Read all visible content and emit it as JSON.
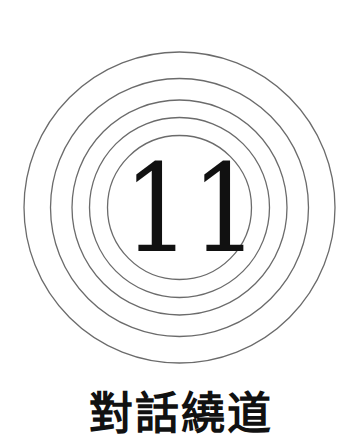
{
  "emblem": {
    "number": "11",
    "digits": [
      "1",
      "1"
    ],
    "rings": [
      {
        "cx": 179.5,
        "cy": 207.5,
        "r": 155.5
      },
      {
        "cx": 179.5,
        "cy": 207.5,
        "r": 129
      },
      {
        "cx": 179.5,
        "cy": 207.5,
        "r": 107.5
      },
      {
        "cx": 179.5,
        "cy": 207.5,
        "r": 90
      },
      {
        "cx": 179.5,
        "cy": 207.5,
        "r": 72
      }
    ],
    "ring_color": "#6b6b6b",
    "digit_color": "#111111"
  },
  "title": "對話繞道"
}
